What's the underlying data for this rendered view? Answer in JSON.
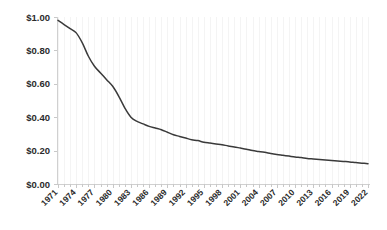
{
  "chart_data": {
    "type": "line",
    "title": "",
    "subtitle": "",
    "xlabel": "",
    "ylabel": "",
    "grid": "faint vertical gridlines only",
    "legend": "none",
    "legend_position": "none",
    "line_color": "#3a3a3a",
    "background_color": "#ffffff",
    "label_color": "#2b2b2b",
    "axis_color": "#d0d0d0",
    "xlim": [
      1971,
      2022
    ],
    "ylim": [
      0.0,
      1.0
    ],
    "ytick_values": [
      1.0,
      0.8,
      0.6,
      0.4,
      0.2,
      0.0
    ],
    "ytick_labels": [
      "$1.00",
      "$0.80",
      "$0.60",
      "$0.40",
      "$0.20",
      "$0.00"
    ],
    "xtick_labels": [
      "1971",
      "1974",
      "1977",
      "1980",
      "1983",
      "1986",
      "1989",
      "1992",
      "1995",
      "1998",
      "2001",
      "2004",
      "2007",
      "2010",
      "2013",
      "2016",
      "2019",
      "2022"
    ],
    "xtick_step_years": 3,
    "x": [
      1971,
      1972,
      1973,
      1974,
      1975,
      1976,
      1977,
      1978,
      1979,
      1980,
      1981,
      1982,
      1983,
      1984,
      1985,
      1986,
      1987,
      1988,
      1989,
      1990,
      1991,
      1992,
      1993,
      1994,
      1995,
      1996,
      1997,
      1998,
      1999,
      2000,
      2001,
      2002,
      2003,
      2004,
      2005,
      2006,
      2007,
      2008,
      2009,
      2010,
      2011,
      2012,
      2013,
      2014,
      2015,
      2016,
      2017,
      2018,
      2019,
      2020,
      2021,
      2022
    ],
    "values": [
      0.98,
      0.955,
      0.93,
      0.905,
      0.845,
      0.765,
      0.705,
      0.665,
      0.625,
      0.585,
      0.525,
      0.455,
      0.4,
      0.375,
      0.36,
      0.345,
      0.335,
      0.325,
      0.31,
      0.295,
      0.285,
      0.275,
      0.265,
      0.26,
      0.25,
      0.245,
      0.24,
      0.235,
      0.228,
      0.222,
      0.215,
      0.208,
      0.2,
      0.195,
      0.19,
      0.183,
      0.177,
      0.172,
      0.167,
      0.162,
      0.158,
      0.153,
      0.15,
      0.147,
      0.144,
      0.141,
      0.138,
      0.135,
      0.132,
      0.128,
      0.125,
      0.122
    ],
    "series": [
      {
        "name": "cost",
        "values": [
          0.98,
          0.955,
          0.93,
          0.905,
          0.845,
          0.765,
          0.705,
          0.665,
          0.625,
          0.585,
          0.525,
          0.455,
          0.4,
          0.375,
          0.36,
          0.345,
          0.335,
          0.325,
          0.31,
          0.295,
          0.285,
          0.275,
          0.265,
          0.26,
          0.25,
          0.245,
          0.24,
          0.235,
          0.228,
          0.222,
          0.215,
          0.208,
          0.2,
          0.195,
          0.19,
          0.183,
          0.177,
          0.172,
          0.167,
          0.162,
          0.158,
          0.153,
          0.15,
          0.147,
          0.144,
          0.141,
          0.138,
          0.135,
          0.132,
          0.128,
          0.125,
          0.122
        ]
      }
    ]
  }
}
